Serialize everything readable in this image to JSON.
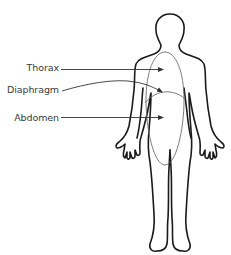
{
  "diagram": {
    "labels": [
      {
        "id": "thorax",
        "text": "Thorax"
      },
      {
        "id": "diaphragm",
        "text": "Diaphragm"
      },
      {
        "id": "abdomen",
        "text": "Abdomen"
      }
    ],
    "colors": {
      "outline": "#1a1a1a",
      "region": "#6e6e6e",
      "label_text": "#3a3a3a",
      "leader_line": "#333333",
      "background": "#ffffff"
    }
  }
}
